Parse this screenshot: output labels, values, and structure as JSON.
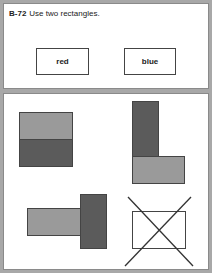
{
  "header": {
    "code": "B-72",
    "instruction": "Use two rectangles."
  },
  "labels": {
    "left": "red",
    "right": "blue"
  },
  "colors": {
    "light_rect": "#9a9a9a",
    "dark_rect": "#5b5b5b",
    "outline": "#444444",
    "frame": "#a8a8a8"
  },
  "figures": [
    {
      "name": "stacked-horizontal",
      "description": "light rectangle on top of dark rectangle forming a square"
    },
    {
      "name": "l-shape",
      "description": "dark vertical rectangle above light horizontal rectangle forming an L"
    },
    {
      "name": "t-sideways",
      "description": "light horizontal rectangle adjoining dark vertical rectangle"
    },
    {
      "name": "crossed-out",
      "description": "single white rectangle crossed out with an X"
    }
  ]
}
